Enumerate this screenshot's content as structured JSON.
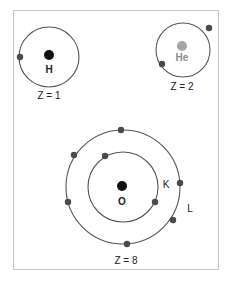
{
  "diagram": {
    "type": "bohr-atomic-models",
    "colors": {
      "orbit": "#555555",
      "electron": "#4a4a4a",
      "nucleus_dark": "#111111",
      "nucleus_he": "#a6a6a6",
      "frame": "#c8c8c8"
    },
    "atoms": [
      {
        "id": "hydrogen",
        "symbol": "H",
        "z_label": "Z = 1",
        "shells": [
          {
            "label": "",
            "electrons": 1
          }
        ]
      },
      {
        "id": "helium",
        "symbol": "He",
        "z_label": "Z = 2",
        "shells": [
          {
            "label": "",
            "electrons": 2
          }
        ]
      },
      {
        "id": "oxygen",
        "symbol": "O",
        "z_label": "Z = 8",
        "shells": [
          {
            "label": "K",
            "electrons": 2
          },
          {
            "label": "L",
            "electrons": 6
          }
        ]
      }
    ]
  }
}
